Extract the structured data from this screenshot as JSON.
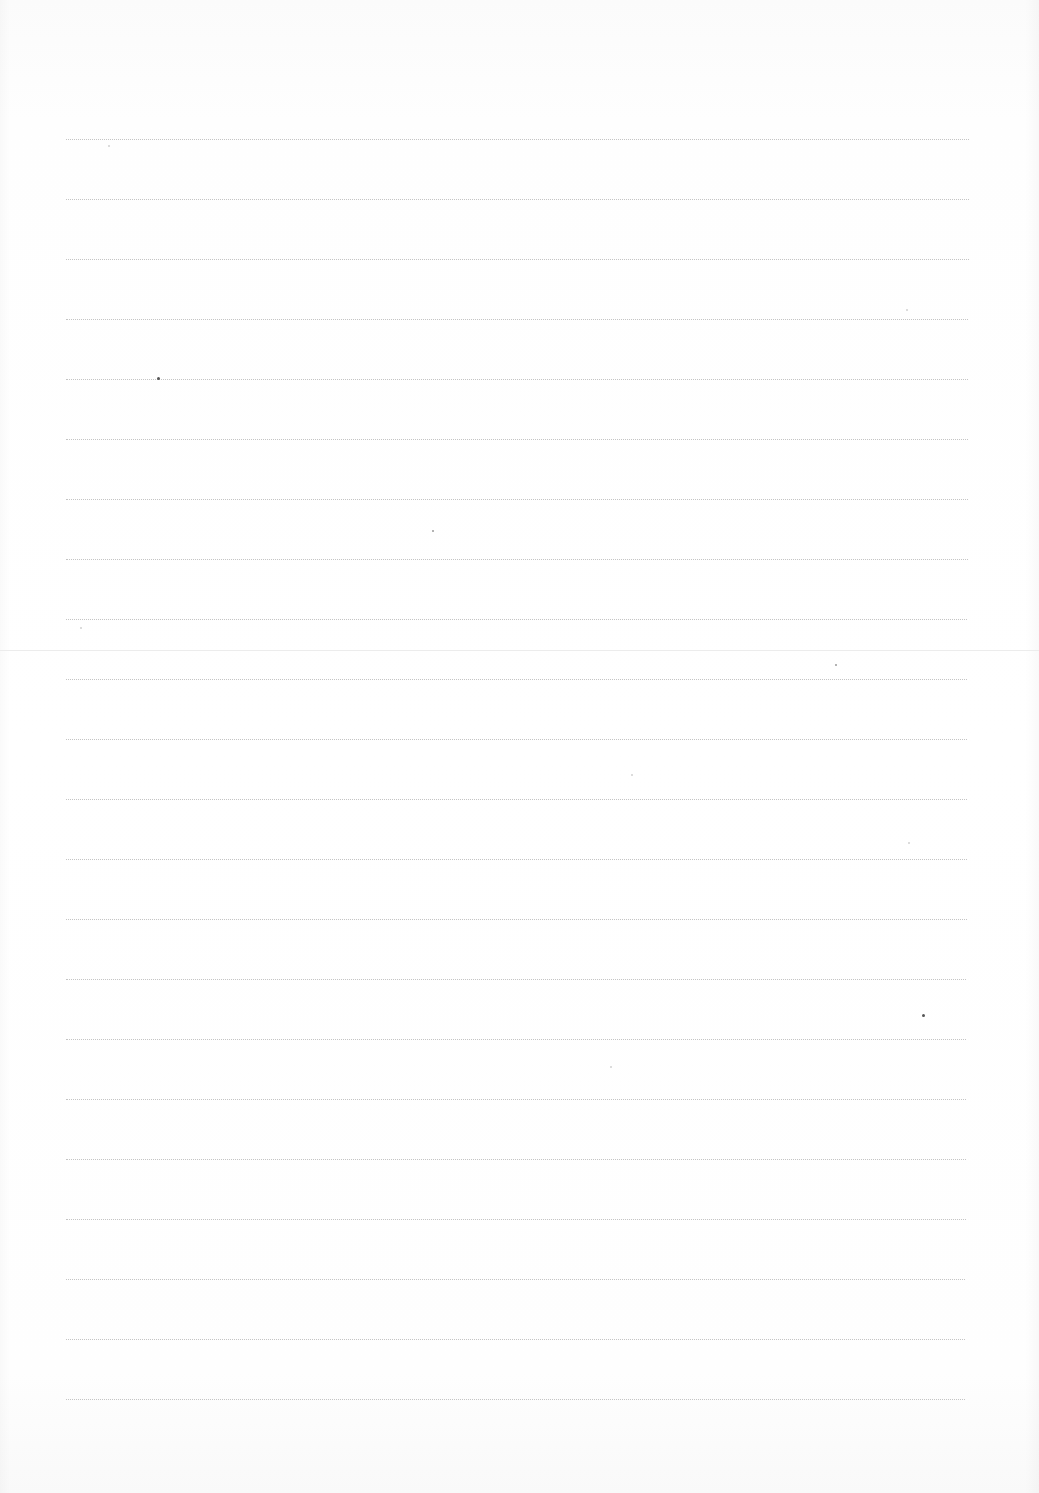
{
  "document": {
    "type": "blank-lined-page",
    "text_content": "",
    "ruled_lines": {
      "count": 22,
      "style": "dotted",
      "color": "#c4c4c4",
      "first_y": 139,
      "spacing": 60,
      "left_x": 66,
      "right_x_top": 969,
      "right_x_bottom": 965
    },
    "fold": {
      "y": 650,
      "color": "#ececec"
    },
    "paper_color": "#ffffff"
  }
}
